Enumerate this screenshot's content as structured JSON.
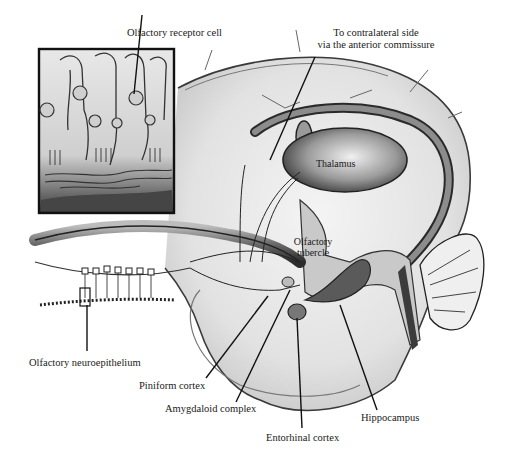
{
  "figure": {
    "labels": {
      "olfactory_receptor_cell": "Olfactory receptor cell",
      "contralateral_line1": "To contralateral side",
      "contralateral_line2": "via the anterior commissure",
      "thalamus": "Thalamus",
      "olfactory_tubercle_line1": "Olfactory",
      "olfactory_tubercle_line2": "tubercle",
      "olfactory_neuroepithelium": "Olfactory neuroepithelium",
      "piniform_cortex": "Piniform cortex",
      "amygdaloid_complex": "Amygdaloid complex",
      "entorhinal_cortex": "Entorhinal cortex",
      "hippocampus": "Hippocampus"
    },
    "colors": {
      "ink": "#1a1a1a",
      "shade_dark": "#4a4a4a",
      "shade_mid": "#8a8a8a",
      "shade_light": "#d9d9d9",
      "background": "#ffffff"
    }
  }
}
